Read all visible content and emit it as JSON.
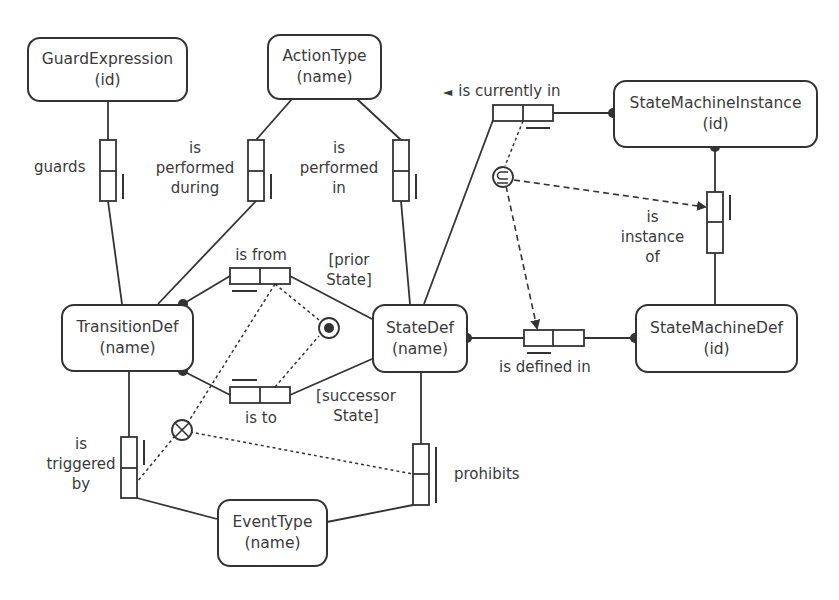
{
  "entities": {
    "guard_expression": {
      "name": "GuardExpression",
      "ref": "(id)"
    },
    "action_type": {
      "name": "ActionType",
      "ref": "(name)"
    },
    "state_machine_instance": {
      "name": "StateMachineInstance",
      "ref": "(id)"
    },
    "transition_def": {
      "name": "TransitionDef",
      "ref": "(name)"
    },
    "state_def": {
      "name": "StateDef",
      "ref": "(name)"
    },
    "state_machine_def": {
      "name": "StateMachineDef",
      "ref": "(id)"
    },
    "event_type": {
      "name": "EventType",
      "ref": "(name)"
    }
  },
  "fact_types": {
    "guards": {
      "reading": "guards"
    },
    "performed_during": {
      "line1": "is",
      "line2": "performed",
      "line3": "during"
    },
    "performed_in": {
      "line1": "is",
      "line2": "performed",
      "line3": "in"
    },
    "currently_in": {
      "arrow": "◄",
      "reading": "is currently in"
    },
    "instance_of": {
      "line1": "is",
      "line2": "instance",
      "line3": "of"
    },
    "is_from": {
      "reading": "is from"
    },
    "is_to": {
      "reading": "is to"
    },
    "defined_in": {
      "reading": "is defined in"
    },
    "triggered_by": {
      "line1": "is",
      "line2": "triggered",
      "line3": "by"
    },
    "prohibits": {
      "reading": "prohibits"
    }
  },
  "role_names": {
    "prior_state": {
      "line1": "[prior",
      "line2": "State]"
    },
    "successor_state": {
      "line1": "[successor",
      "line2": "State]"
    }
  },
  "constraints": {
    "subset": {
      "symbol": "⊆"
    },
    "exclusion": {
      "symbol": "⊗"
    },
    "external_uniqueness": {
      "symbol": "⊙"
    }
  },
  "colors": {
    "stroke": "#333333",
    "text": "#3a3a3a",
    "background": "#ffffff"
  }
}
